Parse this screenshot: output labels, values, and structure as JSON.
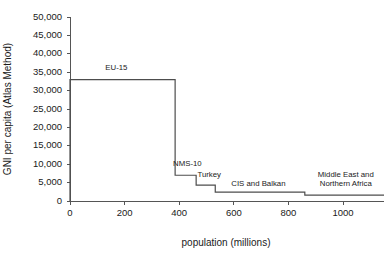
{
  "chart_data": {
    "type": "line",
    "subtype": "step",
    "title": "",
    "xlabel": "population (millions)",
    "ylabel": "GNI per capita (Atlas Method)",
    "xlim": [
      0,
      1150
    ],
    "ylim": [
      0,
      50000
    ],
    "grid": false,
    "legend_position": "inline-annotations",
    "xticks": [
      0,
      200,
      400,
      600,
      800,
      1000
    ],
    "xtick_labels": [
      "0",
      "200",
      "400",
      "600",
      "800",
      "1000"
    ],
    "yticks": [
      0,
      5000,
      10000,
      15000,
      20000,
      25000,
      30000,
      35000,
      40000,
      45000,
      50000
    ],
    "ytick_labels": [
      "0",
      "5,000",
      "10,000",
      "15,000",
      "20,000",
      "25,000",
      "30,000",
      "35,000",
      "40,000",
      "45,000",
      "50,000"
    ],
    "series": [
      {
        "name": "GNI per capita by cumulative population",
        "steps": [
          {
            "label": "EU-15",
            "x_start": 0,
            "x_end": 385,
            "value": 33000
          },
          {
            "label": "NMS-10",
            "x_start": 385,
            "x_end": 462,
            "value": 7000
          },
          {
            "label": "Turkey",
            "x_start": 462,
            "x_end": 532,
            "value": 4300
          },
          {
            "label": "CIS and Balkan",
            "x_start": 532,
            "x_end": 860,
            "value": 2400
          },
          {
            "label": "Middle East and Northern Africa",
            "x_start": 860,
            "x_end": 1150,
            "value": 1600
          }
        ]
      }
    ],
    "annotations": [
      {
        "text": "EU-15",
        "x": 170,
        "y": 35600,
        "lines": [
          "EU-15"
        ]
      },
      {
        "text": "NMS-10",
        "x": 430,
        "y": 9600,
        "lines": [
          "NMS-10"
        ]
      },
      {
        "text": "Turkey",
        "x": 510,
        "y": 6500,
        "lines": [
          "Turkey"
        ]
      },
      {
        "text": "CIS and Balkan",
        "x": 690,
        "y": 4000,
        "lines": [
          "CIS and Balkan"
        ]
      },
      {
        "text": "Middle East and Northern Africa",
        "x": 1010,
        "y": 6600,
        "lines": [
          "Middle East and",
          "Northern Africa"
        ]
      }
    ],
    "colors": {
      "line": "#4d4d4d",
      "axis": "#555555",
      "text": "#1a1a1a",
      "background": "#ffffff"
    }
  }
}
